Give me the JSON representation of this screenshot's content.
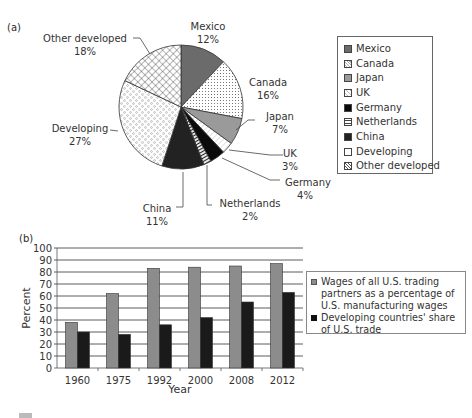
{
  "panel_a": {
    "label": "(a)",
    "legend": [
      {
        "name": "Mexico",
        "pattern": "mexico"
      },
      {
        "name": "Canada",
        "pattern": "canada"
      },
      {
        "name": "Japan",
        "pattern": "japan"
      },
      {
        "name": "UK",
        "pattern": "uk"
      },
      {
        "name": "Germany",
        "pattern": "germany"
      },
      {
        "name": "Netherlands",
        "pattern": "netherlands"
      },
      {
        "name": "China",
        "pattern": "china"
      },
      {
        "name": "Developing",
        "pattern": "developing"
      },
      {
        "name": "Other developed",
        "pattern": "other"
      }
    ],
    "slice_labels": [
      {
        "name": "Mexico",
        "pct": "12%"
      },
      {
        "name": "Canada",
        "pct": "16%"
      },
      {
        "name": "Japan",
        "pct": "7%"
      },
      {
        "name": "UK",
        "pct": "3%"
      },
      {
        "name": "Germany",
        "pct": "4%"
      },
      {
        "name": "Netherlands",
        "pct": "2%"
      },
      {
        "name": "China",
        "pct": "11%"
      },
      {
        "name": "Developing",
        "pct": "27%"
      },
      {
        "name": "Other developed",
        "pct": "18%"
      }
    ]
  },
  "panel_b": {
    "label": "(b)",
    "ylabel": "Percent",
    "xlabel": "Year",
    "yticks": [
      "0",
      "10",
      "20",
      "30",
      "40",
      "50",
      "60",
      "70",
      "80",
      "90",
      "100"
    ],
    "categories": [
      "1960",
      "1975",
      "1992",
      "2000",
      "2008",
      "2012"
    ],
    "legend": [
      "Wages of all U.S. trading partners as a percentage of U.S. manufacturing wages",
      "Developing countries' share of U.S. trade"
    ]
  },
  "colors": {
    "mexico": "#6b6b6b",
    "japan": "#9a9a9a",
    "germany": "#0a0a0a",
    "china": "#222222",
    "bar_grey": "#8c8c8c",
    "bar_black": "#1a1a1a",
    "grid": "#333333"
  },
  "chart_data": [
    {
      "type": "pie",
      "title": "(a)",
      "categories": [
        "Mexico",
        "Canada",
        "Japan",
        "UK",
        "Germany",
        "Netherlands",
        "China",
        "Developing",
        "Other developed"
      ],
      "values": [
        12,
        16,
        7,
        3,
        4,
        2,
        11,
        27,
        18
      ],
      "unit": "%",
      "legend_position": "right",
      "start_angle": "12 o'clock, clockwise"
    },
    {
      "type": "bar",
      "title": "(b)",
      "categories": [
        "1960",
        "1975",
        "1992",
        "2000",
        "2008",
        "2012"
      ],
      "series": [
        {
          "name": "Wages of all U.S. trading partners as a percentage of U.S. manufacturing wages",
          "values": [
            38,
            62,
            83,
            84,
            85,
            87
          ]
        },
        {
          "name": "Developing countries' share of U.S. trade",
          "values": [
            30,
            28,
            36,
            42,
            55,
            63
          ]
        }
      ],
      "xlabel": "Year",
      "ylabel": "Percent",
      "ylim": [
        0,
        100
      ],
      "yticks": [
        0,
        10,
        20,
        30,
        40,
        50,
        60,
        70,
        80,
        90,
        100
      ],
      "grid": true,
      "legend_position": "right"
    }
  ]
}
